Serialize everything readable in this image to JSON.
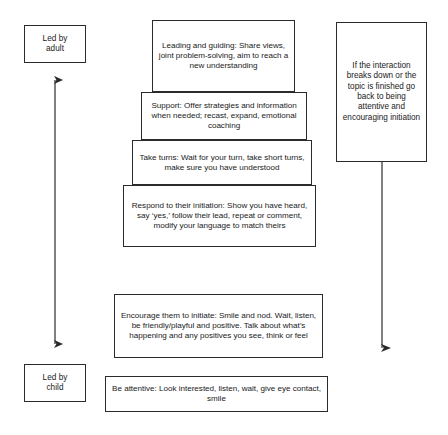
{
  "diagram": {
    "left_labels": [
      {
        "id": "led-by-adult",
        "text": "Led by\nadult"
      },
      {
        "id": "led-by-child",
        "text": "Led by\nchild"
      }
    ],
    "rungs": [
      {
        "id": "leading-and-guiding",
        "text": "Leading and guiding: Share views, joint problem-solving, aim to reach a new understanding"
      },
      {
        "id": "support",
        "text": "Support: Offer strategies and information when needed; recast, expand, emotional coaching"
      },
      {
        "id": "take-turns",
        "text": "Take turns: Wait for your turn, take short turns, make sure you have understood"
      },
      {
        "id": "respond-to-their-initiation",
        "text": "Respond to their initiation: Show you have heard, say ‘yes,’ follow their lead, repeat or comment, modify your language to match theirs"
      },
      {
        "id": "encourage-them-to-initiate",
        "text": "Encourage them to initiate: Smile and nod. Wait, listen, be friendly/playful and positive. Talk about what’s happening and any positives you see, think or feel"
      },
      {
        "id": "be-attentive",
        "text": "Be attentive: Look interested, listen, wait, give eye contact, smile"
      }
    ],
    "side_panel": {
      "id": "reset-guidance",
      "text": "If the interaction breaks down or the topic is finished go back to being attentive and encouraging initiation"
    },
    "arrows": [
      {
        "id": "left-double-arrow",
        "direction": "both"
      },
      {
        "id": "right-down-arrow",
        "direction": "down"
      }
    ],
    "colors": {
      "stroke": "#2b2b2b",
      "text": "#1a1a1a",
      "background": "#ffffff"
    }
  }
}
